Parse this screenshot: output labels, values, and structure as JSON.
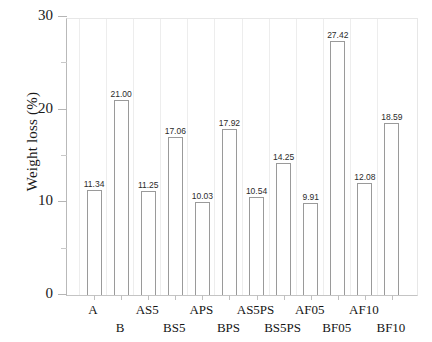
{
  "chart_data": {
    "type": "bar",
    "title": "",
    "subtitle": "",
    "xlabel": "",
    "ylabel": "Weight loss (%)",
    "categories": [
      "A",
      "B",
      "AS5",
      "BS5",
      "APS",
      "BPS",
      "AS5PS",
      "BS5PS",
      "AF05",
      "BF05",
      "AF10",
      "BF10"
    ],
    "values": [
      11.34,
      21.0,
      11.25,
      17.06,
      10.03,
      17.92,
      10.54,
      14.25,
      9.91,
      27.42,
      12.08,
      18.59
    ],
    "value_labels": [
      "11.34",
      "21.00",
      "11.25",
      "17.06",
      "10.03",
      "17.92",
      "10.54",
      "14.25",
      "9.91",
      "27.42",
      "12.08",
      "18.59"
    ],
    "ylim": [
      0,
      30
    ],
    "yticks": [
      0,
      10,
      20,
      30
    ],
    "ytick_labels": [
      "0",
      "10",
      "20",
      "30"
    ],
    "yminor_ticks": [
      5,
      15,
      25
    ],
    "grid": false,
    "legend": null,
    "legend_position": "none",
    "bar_style": {
      "fill": "#ffffff",
      "edge": "#9a9a9a"
    },
    "axis_color": "#b9b9b9",
    "text_color": "#1a1a1a"
  },
  "axis": {
    "y_title": "Weight loss (%)"
  }
}
